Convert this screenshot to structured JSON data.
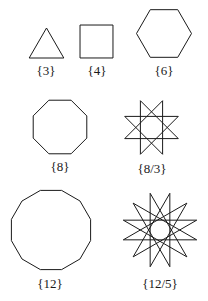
{
  "figure": {
    "line_color": "#1a1a1a",
    "background": "#ffffff"
  },
  "polygons": [
    {
      "id": "triangle",
      "label": "{3}",
      "n": 3,
      "k": 1
    },
    {
      "id": "square",
      "label": "{4}",
      "n": 4,
      "k": 1
    },
    {
      "id": "hexagon",
      "label": "{6}",
      "n": 6,
      "k": 1
    },
    {
      "id": "octagon",
      "label": "{8}",
      "n": 8,
      "k": 1
    },
    {
      "id": "octagram",
      "label": "{8/3}",
      "n": 8,
      "k": 3
    },
    {
      "id": "dodecagon",
      "label": "{12}",
      "n": 12,
      "k": 1
    },
    {
      "id": "dodecagram",
      "label": "{12/5}",
      "n": 12,
      "k": 5
    }
  ]
}
